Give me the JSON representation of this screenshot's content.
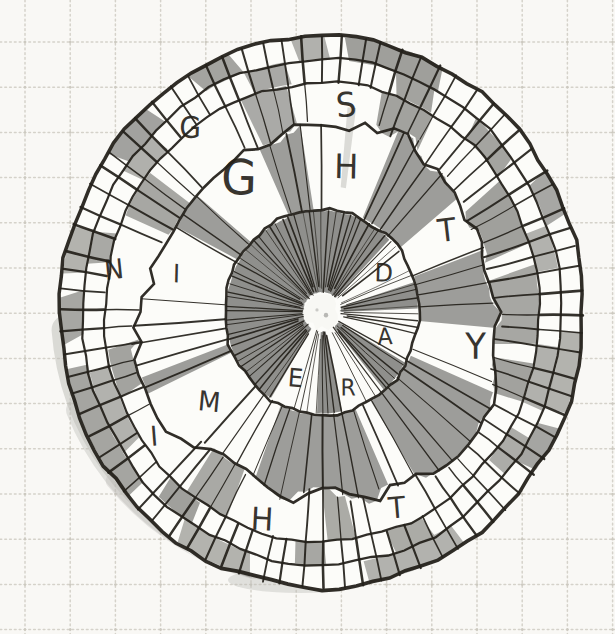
{
  "page": {
    "grid": {
      "spacing": 45.2,
      "offset_x": 25,
      "offset_y": 42
    }
  },
  "colors": {
    "paper": "#f9f8f5",
    "canopy": "#fcfcf9",
    "ink": "#24211b",
    "shade": "#9d9d99",
    "shade_dark": "#90908c",
    "shade_deep": "#868682",
    "grid_dot": "#d5d2ca",
    "shadow": "#bcbbb6",
    "vent": "#f8f8f4"
  },
  "diagram": {
    "type": "parachute-code-sketch",
    "hidden_message": "DARE MIGHTY THINGS",
    "center": {
      "x": 322,
      "y": 312
    },
    "outline_radius": 261.5,
    "vent": {
      "radius": 16
    },
    "rings": [
      {
        "id": "inner-dare",
        "word": "DARE",
        "inner_radius": 20,
        "outer_radius": 96,
        "line_count": 88,
        "letters": [
          {
            "ch": "D",
            "angle": 59,
            "radius": 72,
            "size": 24
          },
          {
            "ch": "A",
            "angle": 110,
            "radius": 67,
            "size": 22
          },
          {
            "ch": "R",
            "angle": 160,
            "radius": 76,
            "size": 22
          },
          {
            "ch": "E",
            "angle": 203,
            "radius": 68,
            "size": 24
          }
        ],
        "shaded_spans": [
          [
            212,
            406
          ],
          [
            73,
            90
          ],
          [
            120,
            140
          ],
          [
            168,
            184
          ]
        ]
      },
      {
        "id": "middle-mighty",
        "word": "MIGHTY",
        "inner_radius": 97,
        "outer_radius": 178,
        "line_count": 58,
        "jagged_outer": true,
        "letters": [
          {
            "ch": "M",
            "angle": 233,
            "radius": 141,
            "size": 26
          },
          {
            "ch": "I",
            "angle": 284,
            "radius": 150,
            "size": 24
          },
          {
            "ch": "G",
            "angle": 327,
            "radius": 152,
            "size": 46
          },
          {
            "ch": "H",
            "angle": 10,
            "radius": 140,
            "size": 32
          },
          {
            "ch": "T",
            "angle": 58,
            "radius": 147,
            "size": 30
          },
          {
            "ch": "Y",
            "angle": 102,
            "radius": 157,
            "size": 34
          }
        ],
        "shaded_spans": [
          [
            24,
            52
          ],
          [
            70,
            95
          ],
          [
            114,
            150
          ],
          [
            158,
            205
          ],
          [
            246,
            252
          ],
          [
            299,
            313
          ],
          [
            338,
            355
          ]
        ]
      },
      {
        "id": "outer-things",
        "word": "THINGS",
        "inner_radius": 178,
        "outer_radius": 217,
        "line_count": 80,
        "letters": [
          {
            "ch": "T",
            "angle": 158,
            "radius": 200,
            "size": 28
          },
          {
            "ch": "H",
            "angle": 197,
            "radius": 205,
            "size": 30
          },
          {
            "ch": "I",
            "angle": 235,
            "radius": 205,
            "size": 26
          },
          {
            "ch": "N",
            "angle": 281,
            "radius": 212,
            "size": 26
          },
          {
            "ch": "G",
            "angle": 323,
            "radius": 219,
            "size": 28
          },
          {
            "ch": "S",
            "angle": 7,
            "radius": 198,
            "size": 32
          }
        ],
        "shaded_spans": [
          [
            16,
            32
          ],
          [
            55,
            74
          ],
          [
            78,
            100
          ],
          [
            103,
            114
          ],
          [
            171,
            180
          ],
          [
            206,
            220
          ],
          [
            248,
            262
          ],
          [
            295,
            308
          ],
          [
            338,
            352
          ]
        ]
      }
    ],
    "outer_rows": [
      {
        "id": "coord-row-inner",
        "inner_radius": 218,
        "outer_radius": 239.5,
        "cell_count": 80,
        "shaded_spans": [
          [
            18,
            30
          ],
          [
            40,
            54
          ],
          [
            70,
            80
          ],
          [
            98,
            113
          ],
          [
            120,
            130
          ],
          [
            152,
            163
          ],
          [
            179,
            187
          ],
          [
            213,
            224
          ],
          [
            236,
            257
          ],
          [
            281,
            290
          ],
          [
            304,
            315
          ],
          [
            341,
            352
          ]
        ]
      },
      {
        "id": "coord-row-outer",
        "inner_radius": 239.5,
        "outer_radius": 261.5,
        "cell_count": 80,
        "shaded_spans": [
          [
            5,
            29
          ],
          [
            59,
            70
          ],
          [
            94,
            112
          ],
          [
            115,
            126
          ],
          [
            147,
            170
          ],
          [
            196,
            215
          ],
          [
            228,
            258
          ],
          [
            263,
            275
          ],
          [
            278,
            289
          ],
          [
            305,
            319
          ],
          [
            329,
            341
          ],
          [
            353,
            362
          ]
        ]
      }
    ]
  }
}
